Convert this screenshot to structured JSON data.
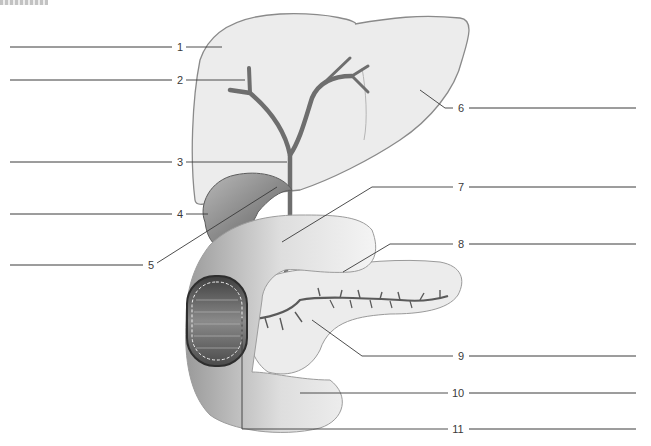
{
  "figure": {
    "top_fragment_text": ""
  },
  "labels": [
    {
      "number": "1",
      "x": 180,
      "y": 47,
      "side": "left"
    },
    {
      "number": "2",
      "x": 180,
      "y": 80,
      "side": "left"
    },
    {
      "number": "3",
      "x": 180,
      "y": 162,
      "side": "left"
    },
    {
      "number": "4",
      "x": 180,
      "y": 214,
      "side": "left"
    },
    {
      "number": "5",
      "x": 151,
      "y": 265,
      "side": "left"
    },
    {
      "number": "6",
      "x": 461,
      "y": 108,
      "side": "right"
    },
    {
      "number": "7",
      "x": 461,
      "y": 187,
      "side": "right"
    },
    {
      "number": "8",
      "x": 461,
      "y": 244,
      "side": "right"
    },
    {
      "number": "9",
      "x": 461,
      "y": 356,
      "side": "right"
    },
    {
      "number": "10",
      "x": 458,
      "y": 393,
      "side": "right"
    },
    {
      "number": "11",
      "x": 458,
      "y": 429,
      "side": "right"
    }
  ],
  "answer_lines": [
    {
      "id": "1",
      "x1": 10,
      "x2": 172,
      "y": 47
    },
    {
      "id": "2",
      "x1": 10,
      "x2": 172,
      "y": 80
    },
    {
      "id": "3",
      "x1": 10,
      "x2": 172,
      "y": 162
    },
    {
      "id": "4",
      "x1": 10,
      "x2": 172,
      "y": 214
    },
    {
      "id": "5",
      "x1": 10,
      "x2": 143,
      "y": 265
    },
    {
      "id": "6",
      "x1": 469,
      "x2": 636,
      "y": 108
    },
    {
      "id": "7",
      "x1": 469,
      "x2": 636,
      "y": 187
    },
    {
      "id": "8",
      "x1": 469,
      "x2": 636,
      "y": 244
    },
    {
      "id": "9",
      "x1": 469,
      "x2": 636,
      "y": 356
    },
    {
      "id": "10",
      "x1": 469,
      "x2": 636,
      "y": 393
    },
    {
      "id": "11",
      "x1": 469,
      "x2": 636,
      "y": 429
    }
  ],
  "colors": {
    "liver_fill": "#ececec",
    "liver_stroke": "#8a8a8a",
    "duct": "#6e6e6e",
    "gallbladder": "#8c8c8c",
    "duodenum": "#c9c9c9",
    "pancreas": "#e9e9e9",
    "leader": "#3a3a3a"
  }
}
